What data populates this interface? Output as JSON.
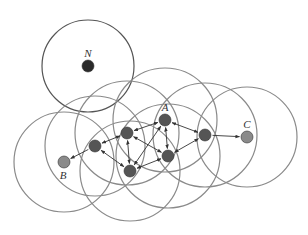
{
  "diagram": {
    "type": "wireless-network-coverage",
    "labels": {
      "N": "N",
      "A": "A",
      "B": "B",
      "C": "C"
    },
    "colors": {
      "circle": "#7a7a7a",
      "node_dark": "#555555",
      "node_light": "#8a8a8a",
      "node_N": "#2a2a2a",
      "arrow": "#333333"
    },
    "nodes": [
      {
        "id": "N",
        "x": 88,
        "y": 66,
        "r": 6,
        "color": "#2a2a2a",
        "label": "N",
        "range": 46
      },
      {
        "id": "B",
        "x": 64,
        "y": 162,
        "r": 6,
        "color": "#8a8a8a",
        "label": "B",
        "range": 50
      },
      {
        "id": "n1",
        "x": 95,
        "y": 146,
        "r": 6,
        "color": "#555555",
        "range": 50
      },
      {
        "id": "n2",
        "x": 127,
        "y": 133,
        "r": 6,
        "color": "#555555",
        "range": 52
      },
      {
        "id": "A",
        "x": 165,
        "y": 120,
        "r": 6,
        "color": "#555555",
        "label": "A",
        "range": 52
      },
      {
        "id": "n5",
        "x": 168,
        "y": 156,
        "r": 6,
        "color": "#555555",
        "range": 52
      },
      {
        "id": "n6",
        "x": 130,
        "y": 171,
        "r": 6,
        "color": "#555555",
        "range": 50
      },
      {
        "id": "n4",
        "x": 205,
        "y": 135,
        "r": 6,
        "color": "#555555",
        "range": 52
      },
      {
        "id": "C",
        "x": 247,
        "y": 137,
        "r": 6,
        "color": "#8a8a8a",
        "label": "C",
        "range": 50
      }
    ],
    "edges": [
      {
        "from": "n1",
        "to": "B",
        "both": false
      },
      {
        "from": "n1",
        "to": "n2",
        "both": true
      },
      {
        "from": "n2",
        "to": "A",
        "both": true
      },
      {
        "from": "n2",
        "to": "n6",
        "both": true
      },
      {
        "from": "n2",
        "to": "n5",
        "both": true
      },
      {
        "from": "n1",
        "to": "n6",
        "both": true
      },
      {
        "from": "A",
        "to": "n5",
        "both": true
      },
      {
        "from": "A",
        "to": "n4",
        "both": true
      },
      {
        "from": "n5",
        "to": "n4",
        "both": true
      },
      {
        "from": "n6",
        "to": "n5",
        "both": true
      },
      {
        "from": "n6",
        "to": "A",
        "both": true
      },
      {
        "from": "n4",
        "to": "C",
        "both": false
      }
    ]
  }
}
